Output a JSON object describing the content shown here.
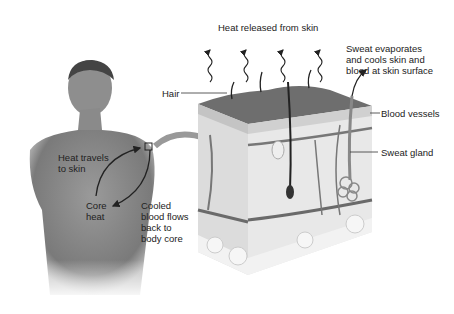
{
  "labels": {
    "heat_released": "Heat released from skin",
    "hair": "Hair",
    "sweat_evaporates": [
      "Sweat evaporates",
      "and cools skin and",
      "blood at skin surface"
    ],
    "blood_vessels": "Blood vessels",
    "sweat_gland": "Sweat gland",
    "heat_travels": [
      "Heat travels",
      "to skin"
    ],
    "core_heat": [
      "Core",
      "heat"
    ],
    "cooled_blood": [
      "Cooled",
      "blood flows",
      "back to",
      "body core"
    ]
  },
  "colors": {
    "skin_top": "#6e6e6e",
    "skin_layer": "#d6d6d6",
    "dermis": "#e6e6e6",
    "fat": "#c8c8c8",
    "vessel": "#6a6a6a",
    "arrow": "#8c8c8c",
    "body": "#8a8a8a"
  }
}
